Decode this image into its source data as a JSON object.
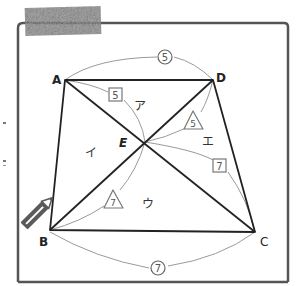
{
  "figure": {
    "type": "trapezoid-with-diagonals",
    "frame_color": "#555555",
    "line_color": "#222222",
    "arc_color": "#999999",
    "vertices": {
      "A": {
        "label": "A",
        "x": 65,
        "y": 80
      },
      "D": {
        "label": "D",
        "x": 213,
        "y": 80
      },
      "B": {
        "label": "B",
        "x": 50,
        "y": 230
      },
      "C": {
        "label": "C",
        "x": 255,
        "y": 232
      },
      "E": {
        "label": "E",
        "x": 145,
        "y": 142
      }
    },
    "regions": {
      "top": {
        "label": "ア"
      },
      "left": {
        "label": "イ"
      },
      "bottom": {
        "label": "ウ"
      },
      "right": {
        "label": "エ"
      }
    },
    "length_marks": {
      "AD": {
        "label": "5",
        "shape": "circle"
      },
      "BC": {
        "label": "7",
        "shape": "circle"
      },
      "AE": {
        "label": "5",
        "shape": "square"
      },
      "EC": {
        "label": "7",
        "shape": "square"
      },
      "DE": {
        "label": "5",
        "shape": "triangle"
      },
      "BE": {
        "label": "7",
        "shape": "triangle"
      }
    }
  },
  "decorations": {
    "tape": "masking-tape",
    "pencil": "pencil"
  }
}
